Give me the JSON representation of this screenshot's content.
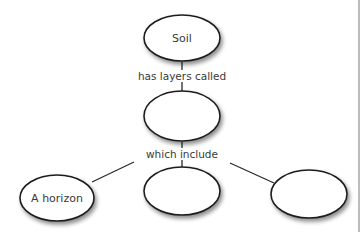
{
  "diagram": {
    "type": "concept-map",
    "nodes": [
      {
        "id": "soil",
        "label": "Soil"
      },
      {
        "id": "layers",
        "label": ""
      },
      {
        "id": "a-horizon",
        "label": "A horizon"
      },
      {
        "id": "blank-middle",
        "label": ""
      },
      {
        "id": "blank-right",
        "label": ""
      }
    ],
    "links": [
      {
        "from": "soil",
        "to": "layers",
        "label": "has layers called"
      },
      {
        "from": "layers",
        "to": "a-horizon",
        "label": "which include"
      },
      {
        "from": "layers",
        "to": "blank-middle",
        "label": "which include"
      },
      {
        "from": "layers",
        "to": "blank-right",
        "label": "which include"
      }
    ],
    "link_labels": {
      "has_layers_called": "has layers called",
      "which_include": "which include"
    }
  }
}
